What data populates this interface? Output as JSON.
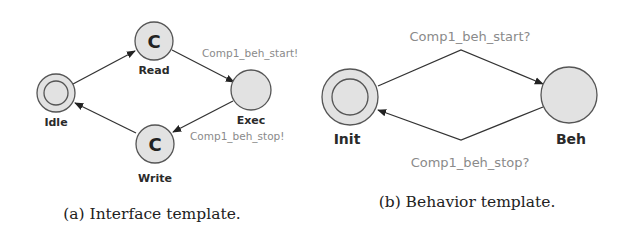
{
  "figures": [
    {
      "id": "a",
      "caption": "(a) Interface template.",
      "nodes": [
        {
          "id": "idle",
          "label": "Idle",
          "initial": true,
          "committed": false
        },
        {
          "id": "read",
          "label": "Read",
          "initial": false,
          "committed": true,
          "mark": "C"
        },
        {
          "id": "exec",
          "label": "Exec",
          "initial": false,
          "committed": false
        },
        {
          "id": "write",
          "label": "Write",
          "initial": false,
          "committed": true,
          "mark": "C"
        }
      ],
      "edges": [
        {
          "from": "idle",
          "to": "read",
          "sync": ""
        },
        {
          "from": "read",
          "to": "exec",
          "sync": "Comp1_beh_start!"
        },
        {
          "from": "exec",
          "to": "write",
          "sync": "Comp1_beh_stop!"
        },
        {
          "from": "write",
          "to": "idle",
          "sync": ""
        }
      ]
    },
    {
      "id": "b",
      "caption": "(b) Behavior template.",
      "nodes": [
        {
          "id": "init",
          "label": "Init",
          "initial": true,
          "committed": false
        },
        {
          "id": "beh",
          "label": "Beh",
          "initial": false,
          "committed": false
        }
      ],
      "edges": [
        {
          "from": "init",
          "to": "beh",
          "sync": "Comp1_beh_start?"
        },
        {
          "from": "beh",
          "to": "init",
          "sync": "Comp1_beh_stop?"
        }
      ]
    }
  ]
}
